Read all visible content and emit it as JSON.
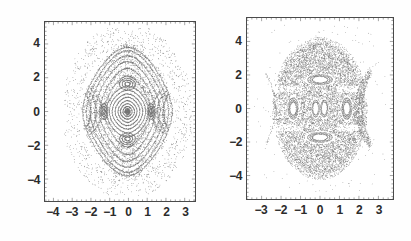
{
  "figure": {
    "background_color": "#ffffff",
    "frame_color": "#4a4a4a",
    "ink_color": "#555555",
    "label_color": "#2b2b2b"
  },
  "panels": [
    {
      "id": "left",
      "name": "poincare-section-left",
      "xlabel": "",
      "ylabel": "",
      "xticks": [
        "-4",
        "-3",
        "-2",
        "-1",
        "0",
        "1",
        "2",
        "3"
      ],
      "xtick_values": [
        -4,
        -3,
        -2,
        -1,
        0,
        1,
        2,
        3
      ],
      "yticks": [
        "4",
        "2",
        "0",
        "-2",
        "-4"
      ],
      "ytick_values": [
        4,
        2,
        0,
        -2,
        -4
      ],
      "xlim": [
        -4.45,
        3.55
      ],
      "ylim": [
        -5.3,
        5.3
      ],
      "grid": false,
      "description": "regular nested KAM tori with four-fold island chain"
    },
    {
      "id": "right",
      "name": "poincare-section-right",
      "xlabel": "",
      "ylabel": "",
      "xticks": [
        "-3",
        "-2",
        "-1",
        "0",
        "1",
        "2",
        "3"
      ],
      "xtick_values": [
        -3,
        -2,
        -1,
        0,
        1,
        2,
        3
      ],
      "yticks": [
        "4",
        "2",
        "0",
        "-2",
        "-4"
      ],
      "ytick_values": [
        4,
        2,
        0,
        -2,
        -4
      ],
      "xlim": [
        -3.75,
        3.75
      ],
      "ylim": [
        -5.4,
        5.4
      ],
      "grid": false,
      "description": "chaotic stochastic sea with embedded regular islands"
    }
  ],
  "chart_data": [
    {
      "type": "scatter",
      "title": "",
      "subtitle": "",
      "xlabel": "",
      "ylabel": "",
      "xlim": [
        -4.45,
        3.55
      ],
      "ylim": [
        -5.3,
        5.3
      ],
      "grid": false,
      "legend": null,
      "xticks": [
        -4,
        -3,
        -2,
        -1,
        0,
        1,
        2,
        3
      ],
      "yticks": [
        -4,
        -2,
        0,
        2,
        4
      ],
      "series": [
        {
          "name": "central-fixed-point-core",
          "kind": "nested-closed-orbits",
          "center": [
            -0.05,
            0.0
          ],
          "radii_x": [
            0.12,
            0.22,
            0.34,
            0.46,
            0.6,
            0.74,
            0.88,
            1.02
          ],
          "radii_y": [
            0.16,
            0.3,
            0.46,
            0.64,
            0.84,
            1.04,
            1.26,
            1.5
          ]
        },
        {
          "name": "inner-island-chain-period-4",
          "kind": "islands",
          "island_centers": [
            [
              -0.05,
              1.62
            ],
            [
              -0.05,
              -1.62
            ],
            [
              -1.3,
              0.0
            ],
            [
              1.2,
              0.0
            ]
          ],
          "island_rx": [
            0.42,
            0.42,
            0.2,
            0.2
          ],
          "island_ry": [
            0.34,
            0.34,
            0.46,
            0.46
          ]
        },
        {
          "name": "outer-nested-tori",
          "kind": "nested-closed-orbits",
          "center": [
            -0.05,
            0.0
          ],
          "radii_x": [
            1.25,
            1.5,
            1.75,
            2.0,
            2.2,
            2.4
          ],
          "radii_y": [
            2.1,
            2.55,
            2.95,
            3.3,
            3.6,
            3.8
          ]
        },
        {
          "name": "outer-crescent-arcs",
          "kind": "arcs",
          "arc_centers": [
            [
              -2.3,
              0.0
            ],
            [
              2.15,
              0.0
            ]
          ],
          "arc_height": 2.6
        }
      ]
    },
    {
      "type": "scatter",
      "title": "",
      "subtitle": "",
      "xlabel": "",
      "ylabel": "",
      "xlim": [
        -3.75,
        3.75
      ],
      "ylim": [
        -5.4,
        5.4
      ],
      "grid": false,
      "legend": null,
      "xticks": [
        -3,
        -2,
        -1,
        0,
        1,
        2,
        3
      ],
      "yticks": [
        -4,
        -2,
        0,
        2,
        4
      ],
      "series": [
        {
          "name": "stochastic-sea",
          "kind": "chaotic-cloud",
          "extent_x": [
            -2.5,
            2.5
          ],
          "extent_y": [
            -4.3,
            4.3
          ],
          "density": "high"
        },
        {
          "name": "central-regular-island-pair",
          "kind": "islands",
          "island_centers": [
            [
              -0.22,
              0.0
            ],
            [
              0.22,
              0.0
            ]
          ],
          "island_rx": [
            0.16,
            0.16
          ],
          "island_ry": [
            0.42,
            0.42
          ]
        },
        {
          "name": "four-fold-white-islands",
          "kind": "islands",
          "island_centers": [
            [
              0.0,
              1.72
            ],
            [
              0.0,
              -1.72
            ],
            [
              -1.38,
              0.0
            ],
            [
              1.38,
              0.0
            ]
          ],
          "island_rx": [
            0.62,
            0.62,
            0.26,
            0.26
          ],
          "island_ry": [
            0.3,
            0.3,
            0.62,
            0.62
          ]
        },
        {
          "name": "outer-boundary-arcs",
          "kind": "arcs",
          "arc_centers": [
            [
              -2.85,
              0.0
            ],
            [
              2.7,
              0.0
            ]
          ],
          "arc_height": 4.0
        }
      ]
    }
  ]
}
